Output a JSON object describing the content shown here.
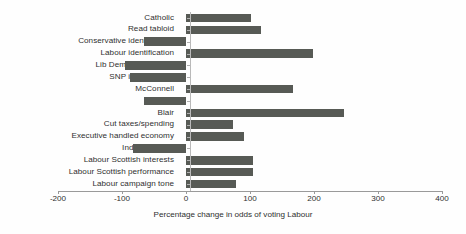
{
  "chart_data": {
    "type": "bar",
    "orientation": "horizontal",
    "title": "",
    "xlabel": "Percentage change in odds of voting Labour",
    "ylabel": "",
    "xlim": [
      -200,
      400
    ],
    "xticks": [
      -200,
      -100,
      0,
      100,
      200,
      300,
      400
    ],
    "xtick_labels": [
      "-200",
      "-100",
      "0",
      "100",
      "200",
      "300",
      "400"
    ],
    "grid": false,
    "legend": null,
    "bar_color": "#575a55",
    "zero_line_color": "#b9b9b9",
    "axis_color": "#9a9a9a",
    "categories": [
      "Catholic",
      "Read tabloid",
      "Conservative identification",
      "Labour identification",
      "Lib Dem identification",
      "SNP identification",
      "McConnell",
      "Goldie",
      "Blair",
      "Cut taxes/spending",
      "Executive handled economy",
      "Independence",
      "Labour Scottish interests",
      "Labour Scottish performance",
      "Labour campaign tone"
    ],
    "values": [
      101,
      117,
      -65,
      198,
      -95,
      -88,
      167,
      -65,
      247,
      74,
      91,
      -83,
      105,
      105,
      78
    ]
  }
}
